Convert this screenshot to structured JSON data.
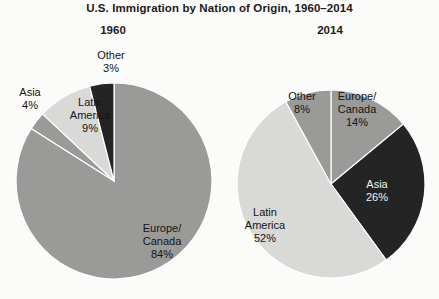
{
  "chart_data": {
    "type": "pie",
    "title": "U.S. Immigration by Nation of Origin, 1960–2014",
    "xlabel": "",
    "ylabel": "",
    "legend": "none (slices labeled in place)",
    "grid": false,
    "units": "percent of U.S. immigrants",
    "panels": [
      {
        "name": "1960",
        "year_label": "1960",
        "center": {
          "x": 114,
          "y": 181
        },
        "radius": 98,
        "start_angle_deg": 0,
        "direction": "clockwise",
        "categories": [
          "Europe/Canada",
          "Other",
          "Latin America",
          "Asia"
        ],
        "values": [
          84,
          3,
          9,
          4
        ],
        "slices": [
          {
            "label": "Europe/\nCanada",
            "label_line1": "Europe/",
            "label_line2": "Canada",
            "value": 84,
            "value_text": "84%",
            "color": "#9a9a98",
            "label_color": "dark",
            "label_position": "inside"
          },
          {
            "label": "Other",
            "label_line1": "Other",
            "label_line2": "",
            "value": 3,
            "value_text": "3%",
            "color": "#9a9a98",
            "label_color": "dark",
            "label_position": "outside-top"
          },
          {
            "label": "Latin America",
            "label_line1": "Latin",
            "label_line2": "America",
            "value": 9,
            "value_text": "9%",
            "color": "#d9d9d7",
            "label_color": "dark",
            "label_position": "outside-top-left"
          },
          {
            "label": "Asia",
            "label_line1": "Asia",
            "label_line2": "",
            "value": 4,
            "value_text": "4%",
            "color": "#242424",
            "label_color": "dark",
            "label_position": "outside-left"
          }
        ]
      },
      {
        "name": "2014",
        "year_label": "2014",
        "center": {
          "x": 331,
          "y": 184
        },
        "radius": 94,
        "start_angle_deg": 0,
        "direction": "clockwise",
        "categories": [
          "Europe/Canada",
          "Asia",
          "Latin America",
          "Other"
        ],
        "values": [
          14,
          26,
          52,
          8
        ],
        "slices": [
          {
            "label": "Europe/\nCanada",
            "label_line1": "Europe/",
            "label_line2": "Canada",
            "value": 14,
            "value_text": "14%",
            "color": "#9a9a98",
            "label_color": "dark",
            "label_position": "inside"
          },
          {
            "label": "Asia",
            "label_line1": "Asia",
            "label_line2": "",
            "value": 26,
            "value_text": "26%",
            "color": "#242424",
            "label_color": "light",
            "label_position": "inside"
          },
          {
            "label": "Latin America",
            "label_line1": "Latin",
            "label_line2": "America",
            "value": 52,
            "value_text": "52%",
            "color": "#d9d9d7",
            "label_color": "dark",
            "label_position": "inside"
          },
          {
            "label": "Other",
            "label_line1": "Other",
            "label_line2": "",
            "value": 8,
            "value_text": "8%",
            "color": "#9a9a98",
            "label_color": "dark",
            "label_position": "inside"
          }
        ]
      }
    ],
    "colors": {
      "europe_canada": "#9a9a98",
      "other": "#9a9a98",
      "latin_america": "#d9d9d7",
      "asia": "#242424",
      "background": "#fbfbfa",
      "text": "#141414",
      "text_on_dark": "#f2f2f0",
      "slice_outline": "#ffffff"
    }
  }
}
